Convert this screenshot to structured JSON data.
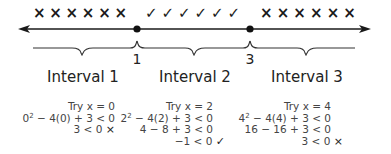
{
  "number_line": {
    "points": [
      {
        "value": "1",
        "x": 137
      },
      {
        "value": "3",
        "x": 250
      }
    ],
    "marks": {
      "interval_1": [
        "×",
        "×",
        "×",
        "×",
        "×",
        "×"
      ],
      "interval_2": [
        "✓",
        "✓",
        "✓",
        "✓",
        "✓",
        "✓"
      ],
      "interval_3": [
        "×",
        "×",
        "×",
        "×",
        "×",
        "×"
      ]
    }
  },
  "intervals": [
    {
      "label": "Interval 1",
      "test": {
        "try": "Try x = 0",
        "line1_base": "0",
        "line1_exp": "2",
        "line1_rest": " − 4(0) + 3 < 0",
        "line2": "3 < 0",
        "result": "×"
      }
    },
    {
      "label": "Interval 2",
      "test": {
        "try": "Try x = 2",
        "line1_base": "2",
        "line1_exp": "2",
        "line1_rest": " − 4(2) + 3 < 0",
        "line2": "4 − 8 + 3 < 0",
        "line3": "−1 < 0",
        "result": "✓"
      }
    },
    {
      "label": "Interval 3",
      "test": {
        "try": "Try x = 4",
        "line1_base": "4",
        "line1_exp": "2",
        "line1_rest": " − 4(4) + 3 < 0",
        "line2": "16 − 16 + 3 < 0",
        "line3": "3 < 0",
        "result": "×"
      }
    }
  ]
}
